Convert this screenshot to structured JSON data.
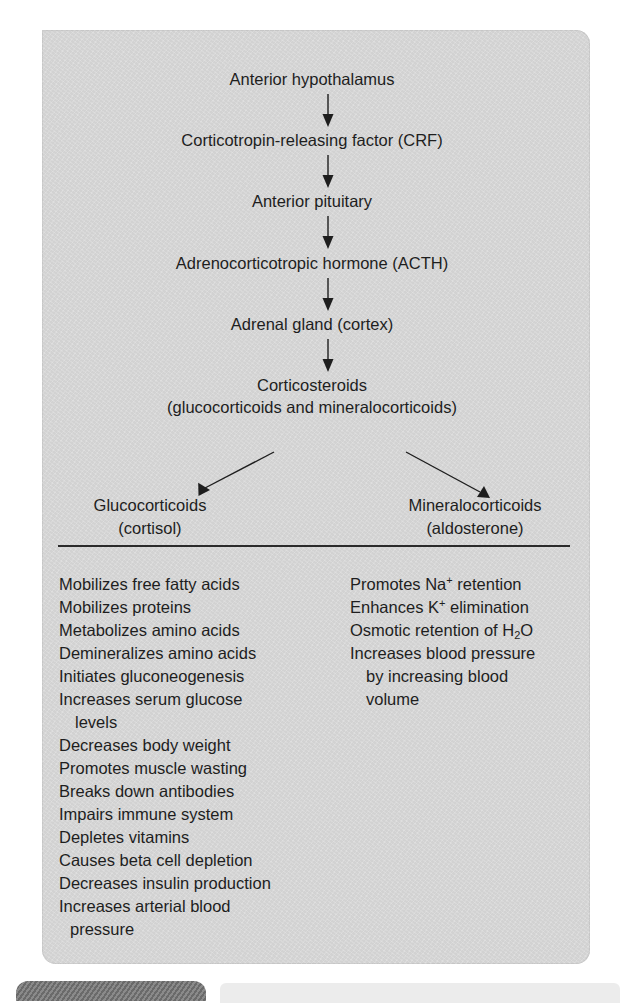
{
  "flow": {
    "nodes": [
      "Anterior hypothalamus",
      "Corticotropin-releasing factor (CRF)",
      "Anterior pituitary",
      "Adrenocorticotropic hormone (ACTH)",
      "Adrenal gland (cortex)",
      "Corticosteroids",
      "(glucocorticoids and mineralocorticoids)"
    ],
    "branches": {
      "left": {
        "name": "Glucocorticoids",
        "example": "(cortisol)"
      },
      "right": {
        "name": "Mineralocorticoids",
        "example": "(aldosterone)"
      }
    }
  },
  "glucocorticoid_effects": [
    "Mobilizes free fatty acids",
    "Mobilizes proteins",
    "Metabolizes amino acids",
    "Demineralizes amino acids",
    "Initiates gluconeogenesis",
    "Increases serum glucose",
    "levels",
    "Decreases body weight",
    "Promotes muscle wasting",
    "Breaks down antibodies",
    "Impairs immune system",
    "Depletes vitamins",
    "Causes beta cell depletion",
    "Decreases insulin production",
    "Increases arterial blood",
    "pressure"
  ],
  "mineralocorticoid_effects": {
    "na": {
      "pre": "Promotes Na",
      "sup": "+",
      "post": " retention"
    },
    "k": {
      "pre": "Enhances K",
      "sup": "+",
      "post": " elimination"
    },
    "h2o": {
      "pre": "Osmotic retention of H",
      "sub": "2",
      "post": "O"
    },
    "bp": "Increases blood pressure",
    "bp_cont1": "by increasing blood",
    "bp_cont2": "volume"
  },
  "colors": {
    "panel": "#dcdcdc",
    "text": "#1e1e1e",
    "tab_dark": "#7a7a7a",
    "tab_light": "#ececec"
  }
}
